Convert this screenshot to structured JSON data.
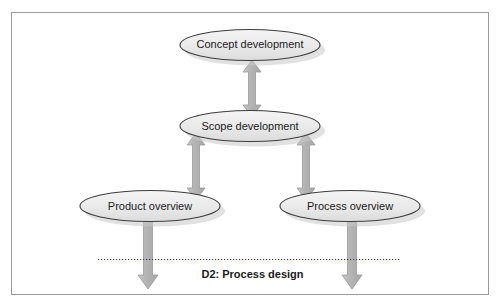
{
  "diagram": {
    "title_label": "D2: Process design",
    "nodes": [
      {
        "id": "concept",
        "label": "Concept development"
      },
      {
        "id": "scope",
        "label": "Scope development"
      },
      {
        "id": "product",
        "label": "Product overview"
      },
      {
        "id": "process",
        "label": "Process overview"
      }
    ],
    "connectors": [
      {
        "from": "concept",
        "to": "scope",
        "style": "double-headed-vertical-arrow"
      },
      {
        "from": "scope",
        "to": "product",
        "style": "double-headed-vertical-arrow"
      },
      {
        "from": "scope",
        "to": "process",
        "style": "double-headed-vertical-arrow"
      },
      {
        "from": "product",
        "to": "below",
        "style": "single-headed-down-arrow"
      },
      {
        "from": "process",
        "to": "below",
        "style": "single-headed-down-arrow"
      }
    ],
    "divider": {
      "style": "dotted",
      "orientation": "horizontal"
    },
    "colors": {
      "node_fill": "#e8e8e8",
      "node_stroke": "#3d3d3d",
      "arrow_fill": "#b4b4b4",
      "arrow_stroke": "#9a9a9a",
      "frame_stroke": "#9a9a9a",
      "text": "#1b1b1b",
      "background": "#ffffff",
      "divider": "#3a3a8a"
    }
  }
}
